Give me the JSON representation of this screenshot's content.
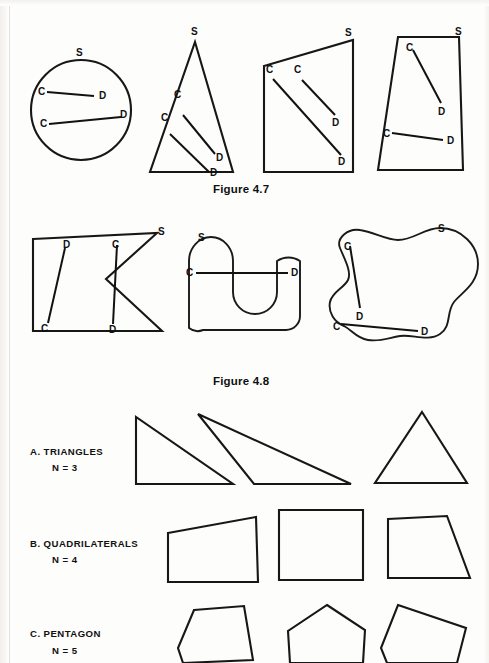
{
  "page": {
    "width": 489,
    "height": 663,
    "background": "#fdfdfb",
    "ink_color": "#171717"
  },
  "figures": [
    {
      "id": "figure-4-7",
      "caption": "Figure 4.7",
      "caption_pos": {
        "x": 213,
        "y": 183
      },
      "description": "Four convex shapes each labeled S with interior chords joining points C and D",
      "shapes": [
        {
          "name": "circle",
          "kind": "circle",
          "cx": 81,
          "cy": 110,
          "r": 50,
          "set_label": "S",
          "set_label_pos": {
            "x": 76,
            "y": 48
          },
          "chords": [
            {
              "c_label": "C",
              "d_label": "D",
              "c_pos": {
                "x": 47,
                "y": 92
              },
              "d_pos": {
                "x": 94,
                "y": 96
              },
              "c_text_pos": {
                "x": 38,
                "y": 87
              },
              "d_text_pos": {
                "x": 99,
                "y": 91
              }
            },
            {
              "c_label": "C",
              "d_label": "D",
              "c_pos": {
                "x": 49,
                "y": 124
              },
              "d_pos": {
                "x": 121,
                "y": 117
              },
              "c_text_pos": {
                "x": 40,
                "y": 119
              },
              "d_text_pos": {
                "x": 120,
                "y": 110
              }
            }
          ]
        },
        {
          "name": "triangle",
          "kind": "polygon",
          "points": "195,42 233,172 150,172",
          "set_label": "S",
          "set_label_pos": {
            "x": 191,
            "y": 27
          },
          "chords": [
            {
              "c_label": "C",
              "d_label": "D",
              "c_pos": {
                "x": 183,
                "y": 115
              },
              "d_pos": {
                "x": 215,
                "y": 154
              },
              "c_text_pos": {
                "x": 174,
                "y": 90
              },
              "d_text_pos": {
                "x": 216,
                "y": 153
              }
            },
            {
              "c_label": "C",
              "d_label": "D",
              "c_pos": {
                "x": 170,
                "y": 134
              },
              "d_pos": {
                "x": 209,
                "y": 172
              },
              "c_text_pos": {
                "x": 161,
                "y": 113
              },
              "d_text_pos": {
                "x": 210,
                "y": 168
              }
            }
          ]
        },
        {
          "name": "quadrilateral-slanted-top",
          "kind": "polygon",
          "points": "353,40 353,172 264,172 264,66",
          "set_label": "S",
          "set_label_pos": {
            "x": 345,
            "y": 28
          },
          "chords": [
            {
              "c_label": "C",
              "d_label": "D",
              "c_pos": {
                "x": 273,
                "y": 79
              },
              "d_pos": {
                "x": 341,
                "y": 155
              },
              "c_text_pos": {
                "x": 266,
                "y": 65
              },
              "d_text_pos": {
                "x": 338,
                "y": 157
              }
            },
            {
              "c_label": "C",
              "d_label": "D",
              "c_pos": {
                "x": 302,
                "y": 80
              },
              "d_pos": {
                "x": 335,
                "y": 115
              },
              "c_text_pos": {
                "x": 294,
                "y": 65
              },
              "d_text_pos": {
                "x": 332,
                "y": 118
              }
            }
          ]
        },
        {
          "name": "trapezoid",
          "kind": "polygon",
          "points": "398,37 459,37 463,170 378,170",
          "set_label": "S",
          "set_label_pos": {
            "x": 455,
            "y": 27
          },
          "chords": [
            {
              "c_label": "C",
              "d_label": "D",
              "c_pos": {
                "x": 413,
                "y": 50
              },
              "d_pos": {
                "x": 441,
                "y": 103
              },
              "c_text_pos": {
                "x": 406,
                "y": 43
              },
              "d_text_pos": {
                "x": 438,
                "y": 107
              }
            },
            {
              "c_label": "C",
              "d_label": "D",
              "c_pos": {
                "x": 392,
                "y": 133
              },
              "d_pos": {
                "x": 443,
                "y": 140
              },
              "c_text_pos": {
                "x": 383,
                "y": 129
              },
              "d_text_pos": {
                "x": 447,
                "y": 136
              }
            }
          ]
        }
      ]
    },
    {
      "id": "figure-4-8",
      "caption": "Figure 4.8",
      "caption_pos": {
        "x": 213,
        "y": 375
      },
      "description": "Three non-convex shapes each labeled S with chords C to D passing outside the set",
      "shapes": [
        {
          "name": "concave-arrowhead-polygon",
          "kind": "polygon",
          "points": "33,239 157,233 106,279 162,331 33,331",
          "set_label": "S",
          "set_label_pos": {
            "x": 158,
            "y": 227
          },
          "chords": [
            {
              "c_label": "C",
              "d_label": "D",
              "c_pos": {
                "x": 48,
                "y": 323
              },
              "d_pos": {
                "x": 65,
                "y": 248
              },
              "c_text_pos": {
                "x": 41,
                "y": 324
              },
              "d_text_pos": {
                "x": 63,
                "y": 240
              }
            },
            {
              "c_label": "C",
              "d_label": "D",
              "c_pos": {
                "x": 117,
                "y": 245
              },
              "d_pos": {
                "x": 113,
                "y": 324
              },
              "c_text_pos": {
                "x": 112,
                "y": 240
              },
              "d_text_pos": {
                "x": 109,
                "y": 325
              }
            }
          ]
        },
        {
          "name": "u-shape",
          "kind": "path",
          "d": "M 189,328 L 189,261 A 22,24 0 0 1 233,261 L 233,292 A 22,22 0 0 0 277,292 L 277,261 A 22,24 0 0 1 300,261 L 300,316 A 14,14 0 0 1 286,330 L 203,330 A 14,14 0 0 1 189,328 Z",
          "set_label": "S",
          "set_label_pos": {
            "x": 198,
            "y": 233
          },
          "chords": [
            {
              "c_label": "C",
              "d_label": "D",
              "c_pos": {
                "x": 196,
                "y": 273
              },
              "d_pos": {
                "x": 288,
                "y": 273
              },
              "c_text_pos": {
                "x": 186,
                "y": 268
              },
              "d_text_pos": {
                "x": 291,
                "y": 268
              }
            }
          ]
        },
        {
          "name": "blob",
          "kind": "path",
          "d": "M 340,248 C 336,238 348,228 360,230 C 374,232 386,240 398,240 C 414,240 424,228 440,228 C 462,228 478,246 478,264 C 478,284 462,292 454,302 C 446,312 452,326 440,334 C 428,342 412,334 400,336 C 388,338 380,342 368,340 C 356,338 352,330 344,326 C 334,322 328,312 330,302 C 332,292 344,288 348,280 C 352,272 344,258 340,248 Z",
          "set_label": "S",
          "set_label_pos": {
            "x": 438,
            "y": 224
          },
          "chords": [
            {
              "c_label": "C",
              "d_label": "D",
              "c_pos": {
                "x": 350,
                "y": 246
              },
              "d_pos": {
                "x": 360,
                "y": 308
              },
              "c_text_pos": {
                "x": 344,
                "y": 242
              },
              "d_text_pos": {
                "x": 356,
                "y": 312
              }
            },
            {
              "c_label": "C",
              "d_label": "D",
              "c_pos": {
                "x": 341,
                "y": 324
              },
              "d_pos": {
                "x": 418,
                "y": 331
              },
              "c_text_pos": {
                "x": 333,
                "y": 322
              },
              "d_text_pos": {
                "x": 421,
                "y": 327
              }
            }
          ]
        }
      ]
    }
  ],
  "polygon_chart": {
    "rows": [
      {
        "id": "row-triangles",
        "label": "A. TRIANGLES",
        "sublabel": "N = 3",
        "label_pos": {
          "x": 30,
          "y": 446
        },
        "sublabel_pos": {
          "x": 52,
          "y": 462
        },
        "shapes": [
          {
            "name": "right-triangle",
            "points": "136,417 136,484 233,484"
          },
          {
            "name": "obtuse-triangle",
            "points": "198,414 351,484 254,484"
          },
          {
            "name": "isosceles-triangle",
            "points": "422,412 467,483 375,483"
          }
        ]
      },
      {
        "id": "row-quadrilaterals",
        "label": "B. QUADRILATERALS",
        "sublabel": "N = 4",
        "label_pos": {
          "x": 30,
          "y": 538
        },
        "sublabel_pos": {
          "x": 52,
          "y": 554
        },
        "shapes": [
          {
            "name": "trapezoid-quad",
            "points": "168,533 256,517 258,582 168,582"
          },
          {
            "name": "square-quad",
            "points": "279,510 363,510 363,580 279,580"
          },
          {
            "name": "right-trapezoid-quad",
            "points": "388,519 447,516 470,578 388,578"
          }
        ]
      },
      {
        "id": "row-pentagon",
        "label": "C.  PENTAGON",
        "sublabel": "N = 5",
        "label_pos": {
          "x": 30,
          "y": 628
        },
        "sublabel_pos": {
          "x": 52,
          "y": 645
        },
        "shapes": [
          {
            "name": "irregular-pentagon",
            "points": "194,610 244,606 253,660 183,663 178,648"
          },
          {
            "name": "regular-pentagon",
            "points": "327,605 365,630 363,663 290,663 288,631"
          },
          {
            "name": "tilted-pentagon",
            "points": "398,605 466,628 457,663 387,663 381,648"
          }
        ]
      }
    ]
  }
}
